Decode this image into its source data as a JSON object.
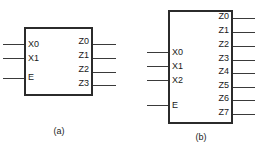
{
  "figure": {
    "background_color": "#ffffff",
    "line_color": "#2b2b2b",
    "text_color": "#1a1a1a"
  },
  "diagrams": [
    {
      "id": "a",
      "caption": "(a)",
      "box": {
        "x": 24,
        "y": 27,
        "width": 69,
        "height": 69
      },
      "caption_pos": {
        "x": 40,
        "y": 126,
        "width": 38
      },
      "inputs": [
        {
          "label": "X0",
          "y": 44,
          "label_x": 28,
          "label_y": 40,
          "wire_x": 3,
          "wire_w": 21
        },
        {
          "label": "X1",
          "y": 58,
          "label_x": 28,
          "label_y": 54,
          "wire_x": 3,
          "wire_w": 21
        },
        {
          "label": "E",
          "y": 78,
          "label_x": 28,
          "label_y": 73,
          "wire_x": 3,
          "wire_w": 21
        }
      ],
      "outputs": [
        {
          "label": "Z0",
          "y": 44,
          "label_x": 71,
          "label_y": 37,
          "wire_x": 93,
          "wire_w": 23
        },
        {
          "label": "Z1",
          "y": 58,
          "label_x": 71,
          "label_y": 51,
          "wire_x": 93,
          "wire_w": 23
        },
        {
          "label": "Z2",
          "y": 72,
          "label_x": 71,
          "label_y": 65,
          "wire_x": 93,
          "wire_w": 23
        },
        {
          "label": "Z3",
          "y": 85,
          "label_x": 71,
          "label_y": 79,
          "wire_x": 93,
          "wire_w": 23
        }
      ]
    },
    {
      "id": "b",
      "caption": "(b)",
      "box": {
        "x": 168,
        "y": 10,
        "width": 65,
        "height": 114
      },
      "caption_pos": {
        "x": 182,
        "y": 132,
        "width": 38
      },
      "inputs": [
        {
          "label": "X0",
          "y": 52,
          "label_x": 172,
          "label_y": 48,
          "wire_x": 147,
          "wire_w": 21
        },
        {
          "label": "X1",
          "y": 66,
          "label_x": 172,
          "label_y": 62,
          "wire_x": 147,
          "wire_w": 21
        },
        {
          "label": "X2",
          "y": 80,
          "label_x": 172,
          "label_y": 76,
          "wire_x": 147,
          "wire_w": 21
        },
        {
          "label": "E",
          "y": 105,
          "label_x": 172,
          "label_y": 101,
          "wire_x": 147,
          "wire_w": 21
        }
      ],
      "outputs": [
        {
          "label": "Z0",
          "y": 18,
          "label_x": 211,
          "label_y": 12,
          "wire_x": 233,
          "wire_w": 22
        },
        {
          "label": "Z1",
          "y": 32,
          "label_x": 211,
          "label_y": 26,
          "wire_x": 233,
          "wire_w": 22
        },
        {
          "label": "Z2",
          "y": 46,
          "label_x": 211,
          "label_y": 40,
          "wire_x": 233,
          "wire_w": 22
        },
        {
          "label": "Z3",
          "y": 60,
          "label_x": 211,
          "label_y": 54,
          "wire_x": 233,
          "wire_w": 22
        },
        {
          "label": "Z4",
          "y": 73,
          "label_x": 211,
          "label_y": 67,
          "wire_x": 233,
          "wire_w": 22
        },
        {
          "label": "Z5",
          "y": 87,
          "label_x": 211,
          "label_y": 81,
          "wire_x": 233,
          "wire_w": 22
        },
        {
          "label": "Z6",
          "y": 100,
          "label_x": 211,
          "label_y": 94,
          "wire_x": 233,
          "wire_w": 22
        },
        {
          "label": "Z7",
          "y": 114,
          "label_x": 211,
          "label_y": 108,
          "wire_x": 233,
          "wire_w": 22
        }
      ]
    }
  ]
}
